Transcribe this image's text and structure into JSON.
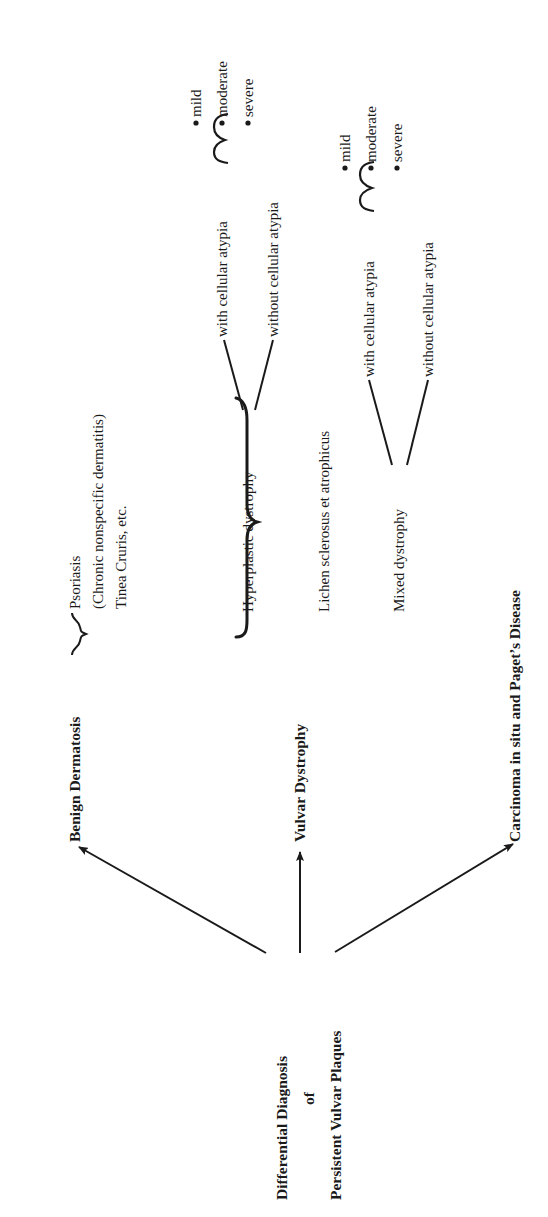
{
  "diagram": {
    "orientation": "rotated-90-ccw",
    "root": {
      "line1": "Differential Diagnosis",
      "line2": "of",
      "line3": "Persistent Vulvar Plaques"
    },
    "branches": [
      {
        "label": "Benign Dermatosis",
        "items": [
          "Psoriasis",
          "(Chronic nonspecific dermatitis)",
          "Tinea Cruris, etc."
        ]
      },
      {
        "label": "Vulvar Dystrophy",
        "subtypes": [
          {
            "label": "Hyperplastic dystrophy",
            "children": [
              {
                "label": "with cellular atypia",
                "grades": [
                  "mild",
                  "moderate",
                  "severe"
                ]
              },
              {
                "label": "without cellular atypia"
              }
            ]
          },
          {
            "label": "Lichen sclerosus et atrophicus"
          },
          {
            "label": "Mixed dystrophy",
            "children": [
              {
                "label": "with cellular atypia",
                "grades": [
                  "mild",
                  "moderate",
                  "severe"
                ]
              },
              {
                "label": "without cellular atypia"
              }
            ]
          }
        ]
      },
      {
        "label": "Carcinoma in situ and Paget’s Disease"
      }
    ],
    "bullet": "•",
    "colors": {
      "ink": "#1a1a1a",
      "background": "#ffffff"
    }
  }
}
